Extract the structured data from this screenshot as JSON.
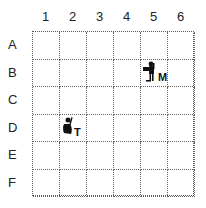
{
  "grid": {
    "columns": [
      "1",
      "2",
      "3",
      "4",
      "5",
      "6"
    ],
    "rows": [
      "A",
      "B",
      "C",
      "D",
      "E",
      "F"
    ]
  },
  "pieces": [
    {
      "name": "explorer-with-mule",
      "cell": "B5",
      "label": "M"
    },
    {
      "name": "knight-with-treasure",
      "cell": "D2",
      "label": "T"
    }
  ]
}
